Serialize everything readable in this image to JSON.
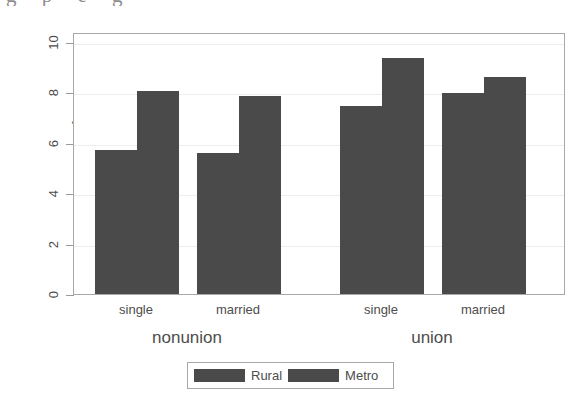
{
  "chart_data": {
    "type": "bar",
    "title": "",
    "xlabel": "",
    "ylabel": "mean of wage",
    "ylim": [
      0,
      10.4
    ],
    "yticks": [
      0,
      2,
      4,
      6,
      8,
      10
    ],
    "ytick_labels": [
      "0",
      "2",
      "4",
      "6",
      "8",
      "10"
    ],
    "grid": true,
    "legend_position": "bottom-center",
    "categories": [
      "single",
      "married",
      "single",
      "married"
    ],
    "supergroups": [
      {
        "label": "nonunion",
        "categories": [
          "single",
          "married"
        ]
      },
      {
        "label": "union",
        "categories": [
          "single",
          "married"
        ]
      }
    ],
    "series": [
      {
        "name": "Rural",
        "color": "#4a4a4a",
        "values": [
          5.73,
          5.6,
          7.48,
          7.98
        ]
      },
      {
        "name": "Metro",
        "color": "#4a4a4a",
        "values": [
          8.05,
          7.85,
          9.35,
          8.6
        ]
      }
    ]
  },
  "axis": {
    "ylabel": "mean of wage",
    "ytick_labels": [
      "10",
      "8",
      "6",
      "4",
      "2",
      "0"
    ]
  },
  "groups": [
    {
      "group_label": "nonunion",
      "cat_labels": [
        "single",
        "married"
      ]
    },
    {
      "group_label": "union",
      "cat_labels": [
        "single",
        "married"
      ]
    }
  ],
  "xticks": [
    {
      "label": "single"
    },
    {
      "label": "married"
    },
    {
      "label": "single"
    },
    {
      "label": "married"
    }
  ],
  "group_labels": [
    {
      "label": "nonunion"
    },
    {
      "label": "union"
    }
  ],
  "legend": {
    "entries": [
      {
        "label": "Rural",
        "color": "#4a4a4a"
      },
      {
        "label": "Metro",
        "color": "#4a4a4a"
      }
    ]
  },
  "colors": {
    "bar_fill": "#4a4a4a",
    "frame": "#a8a8a8",
    "grid": "#ededed",
    "text": "#4d4d4d"
  },
  "top_sliver_text": "g p e g"
}
